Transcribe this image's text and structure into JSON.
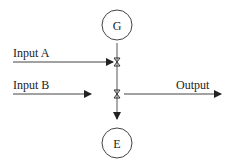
{
  "diagram": {
    "nodes": [
      {
        "id": "G",
        "label": "G"
      },
      {
        "id": "E",
        "label": "E"
      }
    ],
    "inputs": [
      {
        "id": "input-a",
        "label": "Input A"
      },
      {
        "id": "input-b",
        "label": "Input B"
      }
    ],
    "output": {
      "label": "Output"
    },
    "colors": {
      "stroke": "#333333",
      "text": "#222222"
    }
  }
}
